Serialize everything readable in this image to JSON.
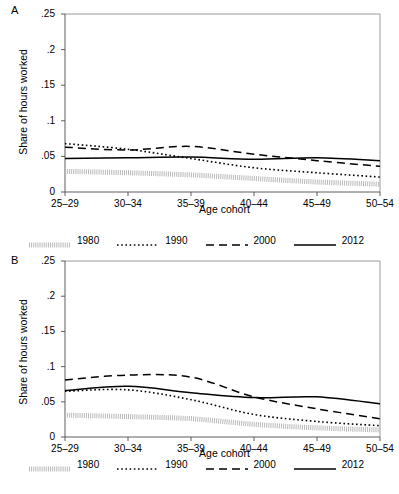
{
  "figure": {
    "panels": [
      {
        "letter": "A",
        "ylabel": "Share of hours worked",
        "xlabel": "Age cohort"
      },
      {
        "letter": "B",
        "ylabel": "Share of hours worked",
        "xlabel": "Age cohort"
      }
    ],
    "legend": {
      "items": [
        {
          "label": "1980",
          "style": "dotted-gray",
          "color": "#b9b9b9"
        },
        {
          "label": "1990",
          "style": "dotted",
          "color": "#000000"
        },
        {
          "label": "2000",
          "style": "dashed",
          "color": "#000000"
        },
        {
          "label": "2012",
          "style": "solid",
          "color": "#000000"
        }
      ]
    }
  },
  "chart_data": [
    {
      "type": "line",
      "panel": "A",
      "title": "",
      "xlabel": "Age cohort",
      "ylabel": "Share of hours worked",
      "categories": [
        "25–29",
        "30–34",
        "35–39",
        "40–44",
        "45–49",
        "50–54"
      ],
      "ylim": [
        0,
        0.25
      ],
      "yticks": [
        0,
        0.05,
        0.1,
        0.15,
        0.2,
        0.25
      ],
      "ytick_labels": [
        "0",
        ".05",
        ".1",
        ".15",
        ".2",
        ".25"
      ],
      "grid": false,
      "legend_position": "bottom",
      "series": [
        {
          "name": "1980",
          "style": "dotted-gray",
          "color": "#b9b9b9",
          "values": [
            0.029,
            0.027,
            0.024,
            0.019,
            0.014,
            0.011
          ]
        },
        {
          "name": "1990",
          "style": "dotted",
          "color": "#000000",
          "values": [
            0.068,
            0.06,
            0.047,
            0.034,
            0.027,
            0.021
          ]
        },
        {
          "name": "2000",
          "style": "dashed",
          "color": "#000000",
          "values": [
            0.063,
            0.059,
            0.064,
            0.053,
            0.044,
            0.036
          ]
        },
        {
          "name": "2012",
          "style": "solid",
          "color": "#000000",
          "values": [
            0.047,
            0.048,
            0.049,
            0.046,
            0.048,
            0.044
          ]
        }
      ]
    },
    {
      "type": "line",
      "panel": "B",
      "title": "",
      "xlabel": "Age cohort",
      "ylabel": "Share of hours worked",
      "categories": [
        "25–29",
        "30–34",
        "35–39",
        "40–44",
        "45–49",
        "50–54"
      ],
      "ylim": [
        0,
        0.25
      ],
      "yticks": [
        0,
        0.05,
        0.1,
        0.15,
        0.2,
        0.25
      ],
      "ytick_labels": [
        "0",
        ".05",
        ".1",
        ".15",
        ".2",
        ".25"
      ],
      "grid": false,
      "legend_position": "bottom",
      "series": [
        {
          "name": "1980",
          "style": "dotted-gray",
          "color": "#b9b9b9",
          "values": [
            0.031,
            0.029,
            0.026,
            0.018,
            0.013,
            0.01
          ]
        },
        {
          "name": "1990",
          "style": "dotted",
          "color": "#000000",
          "values": [
            0.065,
            0.067,
            0.053,
            0.032,
            0.022,
            0.016
          ]
        },
        {
          "name": "2000",
          "style": "dashed",
          "color": "#000000",
          "values": [
            0.081,
            0.088,
            0.085,
            0.057,
            0.04,
            0.026
          ]
        },
        {
          "name": "2012",
          "style": "solid",
          "color": "#000000",
          "values": [
            0.066,
            0.072,
            0.063,
            0.056,
            0.057,
            0.047
          ]
        }
      ]
    }
  ]
}
